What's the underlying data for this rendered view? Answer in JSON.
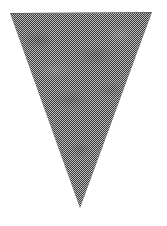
{
  "figure": {
    "name": "inverted-triangle",
    "colors": {
      "background": "#ffffff",
      "dither_dark": "#3f3f3f",
      "dither_light": "#b8b8b8",
      "edge": "#5a5a5a"
    },
    "vertices": [
      [
        10,
        13
      ],
      [
        152,
        12
      ],
      [
        80,
        208
      ]
    ],
    "edge_inset_px": 1.5
  }
}
